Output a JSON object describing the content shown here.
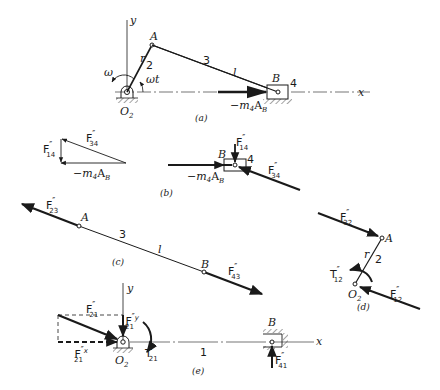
{
  "figure": {
    "panels": {
      "a": {
        "caption": "(a)",
        "labels": {
          "y_axis": "y",
          "x_axis": "x",
          "point_A": "A",
          "point_B": "B",
          "pivot": "O",
          "pivot_sub": "2",
          "crank_r": "r",
          "crank_num": "2",
          "rod_num": "3",
          "rod_l": "l",
          "slider_num": "4",
          "omega": "ω",
          "angle": "ωt",
          "inertia_force": "−m",
          "inertia_force_sub": "4",
          "inertia_force_A": "A",
          "inertia_force_Asub": "B"
        }
      },
      "b": {
        "caption": "(b)",
        "triangle": {
          "F14": "F",
          "F14_sub": "14",
          "F34": "F",
          "F34_sub": "34",
          "m4AB": "−m",
          "m4AB_sub": "4",
          "m4AB_A": "A",
          "m4AB_Asub": "B"
        },
        "slider": {
          "point_B": "B",
          "slider_num": "4",
          "F14": "F",
          "F14_sub": "14",
          "F34": "F",
          "F34_sub": "34",
          "m4AB": "−m",
          "m4AB_sub": "4",
          "m4AB_A": "A",
          "m4AB_Asub": "B"
        }
      },
      "c": {
        "caption": "(c)",
        "labels": {
          "F23": "F",
          "F23_sub": "23",
          "point_A": "A",
          "rod_num": "3",
          "rod_l": "l",
          "point_B": "B",
          "F43": "F",
          "F43_sub": "43"
        }
      },
      "d": {
        "caption": "(d)",
        "labels": {
          "F32": "F",
          "F32_sub": "32",
          "point_A": "A",
          "crank_r": "r",
          "crank_num": "2",
          "T12": "T",
          "T12_sub": "12",
          "pivot": "O",
          "pivot_sub": "2",
          "F12": "F",
          "F12_sub": "12"
        }
      },
      "e": {
        "caption": "(e)",
        "labels": {
          "y_axis": "y",
          "x_axis": "x",
          "F21": "F",
          "F21_sub": "21",
          "F21y": "F",
          "F21y_sup": "y",
          "F21y_sub": "21",
          "F21x": "F",
          "F21x_sup": "x",
          "F21x_sub": "21",
          "pivot": "O",
          "pivot_sub": "2",
          "T21": "T",
          "T21_sub": "21",
          "frame_num": "1",
          "point_B": "B",
          "F41": "F",
          "F41_sub": "41"
        }
      }
    },
    "prime_mark": "″",
    "colors": {
      "ink": "#1a1a1a",
      "background": "#ffffff"
    }
  }
}
